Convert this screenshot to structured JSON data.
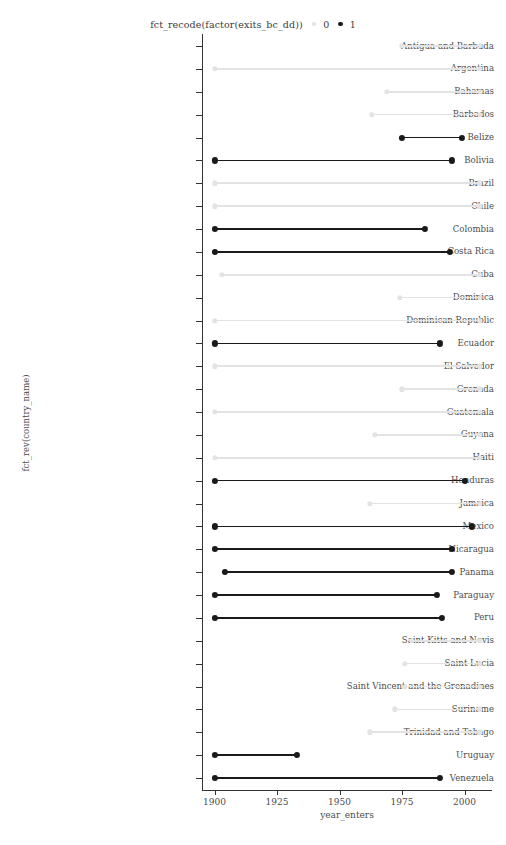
{
  "legend": {
    "title": "fct_recode(factor(exits_bc_dd))",
    "keys": [
      {
        "label": "0",
        "color": "#e3e3e3"
      },
      {
        "label": "1",
        "color": "#1a1a1a"
      }
    ]
  },
  "axes": {
    "x_title": "year_enters",
    "y_title": "fct_rev(country_name)",
    "x_ticks": [
      1900,
      1925,
      1950,
      1975,
      2000
    ],
    "x_tick_labels": [
      "1900",
      "1925",
      "1950",
      "1975",
      "2000"
    ],
    "x_range": [
      1895,
      2011
    ]
  },
  "chart_data": {
    "type": "line",
    "title": "",
    "subtitle": "",
    "xlabel": "year_enters",
    "ylabel": "fct_rev(country_name)",
    "xlim": [
      1895,
      2011
    ],
    "grid": false,
    "legend_position": "top",
    "legend_title": "fct_recode(factor(exits_bc_dd))",
    "series": [
      {
        "name": "0",
        "color": "#e3e3e3"
      },
      {
        "name": "1",
        "color": "#1a1a1a"
      }
    ],
    "categories": [
      "Antigua and Barbuda",
      "Argentina",
      "Bahamas",
      "Barbados",
      "Belize",
      "Bolivia",
      "Brazil",
      "Chile",
      "Colombia",
      "Costa Rica",
      "Cuba",
      "Dominica",
      "Dominican Republic",
      "Ecuador",
      "El Salvador",
      "Grenada",
      "Guatemala",
      "Guyana",
      "Haiti",
      "Honduras",
      "Jamaica",
      "Mexico",
      "Nicaragua",
      "Panama",
      "Paraguay",
      "Peru",
      "Saint Kitts and Nevis",
      "Saint Lucia",
      "Saint Vincent and the Grenadines",
      "Suriname",
      "Trinidad and Tobago",
      "Uruguay",
      "Venezuela"
    ],
    "rows": [
      {
        "country": "Antigua and Barbuda",
        "start": 1975,
        "end": 2006,
        "group": "0"
      },
      {
        "country": "Argentina",
        "start": 1900,
        "end": 2006,
        "group": "0"
      },
      {
        "country": "Bahamas",
        "start": 1969,
        "end": 2006,
        "group": "0"
      },
      {
        "country": "Barbados",
        "start": 1963,
        "end": 2006,
        "group": "0"
      },
      {
        "country": "Belize",
        "start": 1975,
        "end": 1999,
        "group": "1"
      },
      {
        "country": "Bolivia",
        "start": 1900,
        "end": 1995,
        "group": "1"
      },
      {
        "country": "Brazil",
        "start": 1900,
        "end": 2006,
        "group": "0"
      },
      {
        "country": "Chile",
        "start": 1900,
        "end": 2006,
        "group": "0"
      },
      {
        "country": "Colombia",
        "start": 1900,
        "end": 1984,
        "group": "1"
      },
      {
        "country": "Costa Rica",
        "start": 1900,
        "end": 1994,
        "group": "1"
      },
      {
        "country": "Cuba",
        "start": 1903,
        "end": 2006,
        "group": "0"
      },
      {
        "country": "Dominica",
        "start": 1974,
        "end": 2006,
        "group": "0"
      },
      {
        "country": "Dominican Republic",
        "start": 1900,
        "end": 2006,
        "group": "0"
      },
      {
        "country": "Ecuador",
        "start": 1900,
        "end": 1990,
        "group": "1"
      },
      {
        "country": "El Salvador",
        "start": 1900,
        "end": 2006,
        "group": "0"
      },
      {
        "country": "Grenada",
        "start": 1975,
        "end": 2006,
        "group": "0"
      },
      {
        "country": "Guatemala",
        "start": 1900,
        "end": 2006,
        "group": "0"
      },
      {
        "country": "Guyana",
        "start": 1964,
        "end": 2006,
        "group": "0"
      },
      {
        "country": "Haiti",
        "start": 1900,
        "end": 2006,
        "group": "0"
      },
      {
        "country": "Honduras",
        "start": 1900,
        "end": 2000,
        "group": "1"
      },
      {
        "country": "Jamaica",
        "start": 1962,
        "end": 2006,
        "group": "0"
      },
      {
        "country": "Mexico",
        "start": 1900,
        "end": 2003,
        "group": "1"
      },
      {
        "country": "Nicaragua",
        "start": 1900,
        "end": 1995,
        "group": "1"
      },
      {
        "country": "Panama",
        "start": 1904,
        "end": 1995,
        "group": "1"
      },
      {
        "country": "Paraguay",
        "start": 1900,
        "end": 1989,
        "group": "1"
      },
      {
        "country": "Peru",
        "start": 1900,
        "end": 1991,
        "group": "1"
      },
      {
        "country": "Saint Kitts and Nevis",
        "start": 1979,
        "end": 2006,
        "group": "0"
      },
      {
        "country": "Saint Lucia",
        "start": 1976,
        "end": 2006,
        "group": "0"
      },
      {
        "country": "Saint Vincent and the Grenadines",
        "start": 1976,
        "end": 2006,
        "group": "0"
      },
      {
        "country": "Suriname",
        "start": 1972,
        "end": 2006,
        "group": "0"
      },
      {
        "country": "Trinidad and Tobago",
        "start": 1962,
        "end": 2006,
        "group": "0"
      },
      {
        "country": "Uruguay",
        "start": 1900,
        "end": 1933,
        "group": "1"
      },
      {
        "country": "Venezuela",
        "start": 1900,
        "end": 1990,
        "group": "1"
      }
    ]
  }
}
